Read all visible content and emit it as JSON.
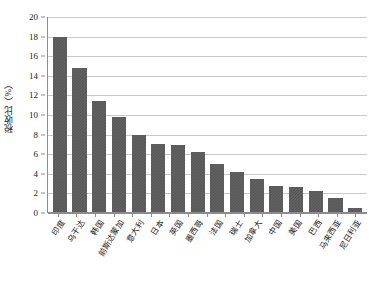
{
  "chart_data": {
    "type": "bar",
    "title": "",
    "xlabel": "",
    "ylabel": "税收比（%）",
    "ylim": [
      0,
      20
    ],
    "ytick_step": 2,
    "yticks": [
      "0",
      "2",
      "4",
      "6",
      "8",
      "10",
      "12",
      "14",
      "16",
      "18",
      "20"
    ],
    "grid": true,
    "legend": "none",
    "bar_color": "#565656",
    "axis_color": "#8c8c8c",
    "gridline_color": "#c9c9c9",
    "categories": [
      "印度",
      "乌干达",
      "韩国",
      "前斯达蒙加",
      "意大利",
      "日本",
      "英国",
      "墨西哥",
      "法国",
      "瑞士",
      "加拿大",
      "中国",
      "美国",
      "巴西",
      "马来西亚",
      "尼日利亚"
    ],
    "values": [
      18.0,
      14.8,
      11.4,
      9.7,
      7.9,
      7.0,
      6.9,
      6.2,
      4.9,
      4.1,
      3.4,
      2.7,
      2.6,
      2.2,
      1.4,
      0.4
    ]
  }
}
